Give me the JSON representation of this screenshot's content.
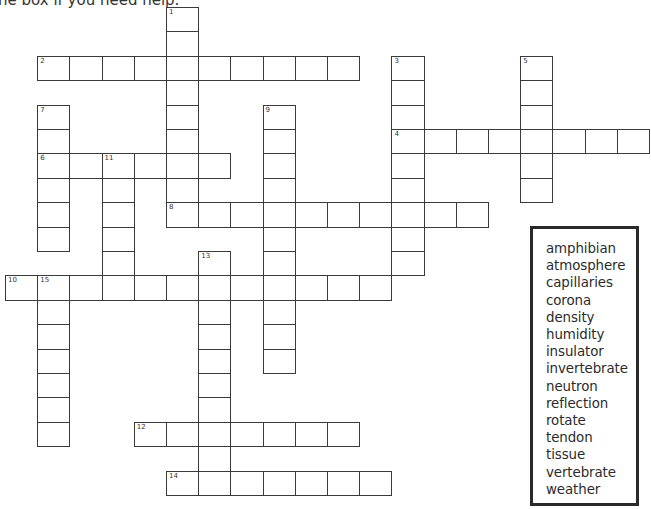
{
  "header": {
    "instruction_fragment": "he box if you need help."
  },
  "grid_geometry": {
    "origin_x": 5,
    "origin_y": 7,
    "cell_width": 32.2,
    "cell_height": 24.4
  },
  "entries": [
    {
      "number": "1",
      "direction": "down",
      "col": 5,
      "row": 0,
      "length": 9
    },
    {
      "number": "2",
      "direction": "across",
      "col": 1,
      "row": 2,
      "length": 10
    },
    {
      "number": "3",
      "direction": "down",
      "col": 12,
      "row": 2,
      "length": 9
    },
    {
      "number": "4",
      "direction": "across",
      "col": 12,
      "row": 5,
      "length": 8
    },
    {
      "number": "5",
      "direction": "down",
      "col": 16,
      "row": 2,
      "length": 6
    },
    {
      "number": "6",
      "direction": "across",
      "col": 1,
      "row": 6,
      "length": 6
    },
    {
      "number": "7",
      "direction": "down",
      "col": 1,
      "row": 4,
      "length": 6
    },
    {
      "number": "8",
      "direction": "across",
      "col": 5,
      "row": 8,
      "length": 10
    },
    {
      "number": "9",
      "direction": "down",
      "col": 8,
      "row": 4,
      "length": 11
    },
    {
      "number": "10",
      "direction": "across",
      "col": 0,
      "row": 11,
      "length": 12
    },
    {
      "number": "11",
      "direction": "down",
      "col": 3,
      "row": 6,
      "length": 6
    },
    {
      "number": "12",
      "direction": "across",
      "col": 4,
      "row": 17,
      "length": 7
    },
    {
      "number": "13",
      "direction": "down",
      "col": 6,
      "row": 10,
      "length": 10
    },
    {
      "number": "14",
      "direction": "across",
      "col": 5,
      "row": 19,
      "length": 7
    },
    {
      "number": "15",
      "direction": "down",
      "col": 1,
      "row": 11,
      "length": 7
    }
  ],
  "word_bank": {
    "words": [
      "amphibian",
      "atmosphere",
      "capillaries",
      "corona",
      "density",
      "humidity",
      "insulator",
      "invertebrate",
      "neutron",
      "reflection",
      "rotate",
      "tendon",
      "tissue",
      "vertebrate",
      "weather"
    ]
  }
}
